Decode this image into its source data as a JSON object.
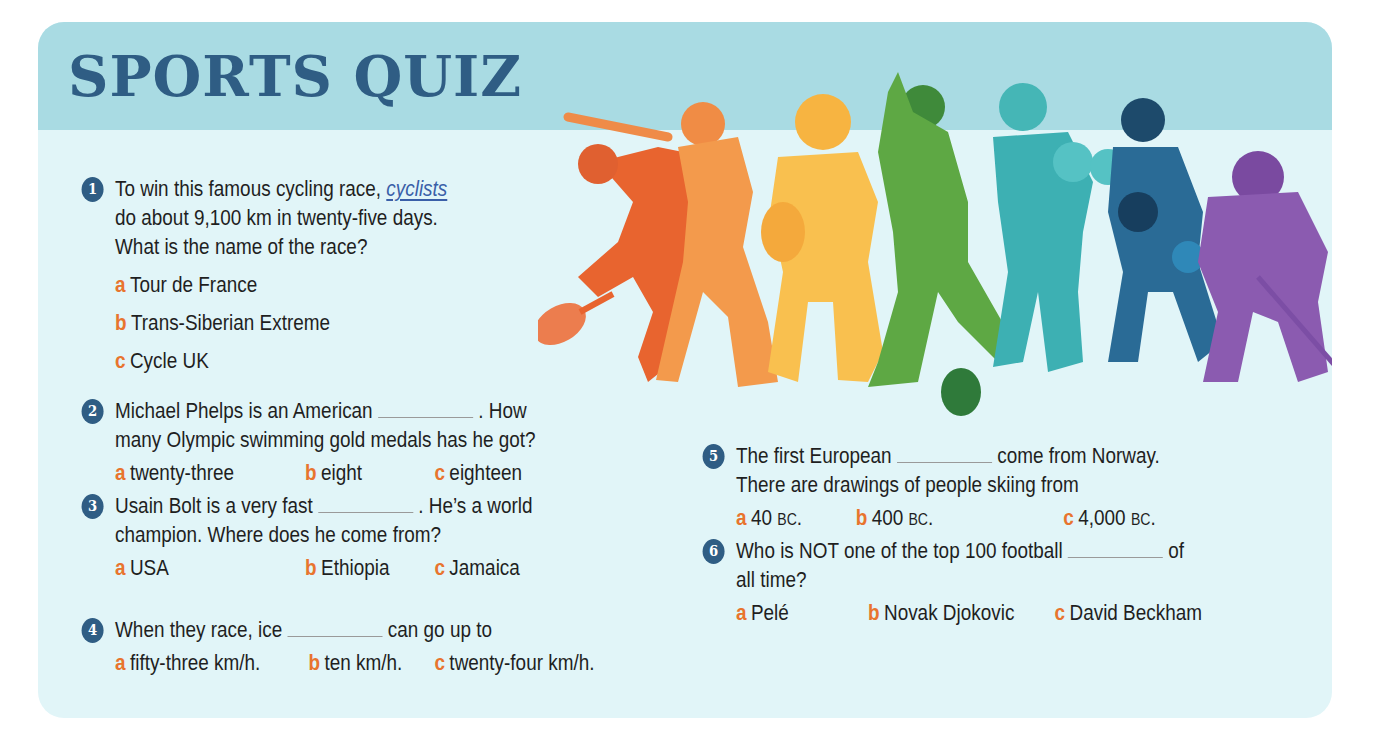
{
  "title": "SPORTS QUIZ",
  "colors": {
    "title": "#2f5d84",
    "header_band": "#a9dbe3",
    "card_bg": "#e1f5f8",
    "option_letter": "#e8742e",
    "badge": "#2f5d84",
    "link": "#3a5fa8"
  },
  "illustration": {
    "description": "sports-silhouettes",
    "figures": [
      "tennis-player",
      "baseball-batter",
      "american-football-player",
      "footballer",
      "boxer",
      "basketball-player",
      "ice-hockey-player"
    ]
  },
  "questions": [
    {
      "number": "1",
      "lines": [
        "To win this famous cycling race, ",
        "do about 9,100 km in twenty-five days.",
        "What is the name of the race?"
      ],
      "gap_word": "cyclists",
      "options": [
        {
          "letter": "a",
          "text": "Tour de France"
        },
        {
          "letter": "b",
          "text": "Trans-Siberian Extreme"
        },
        {
          "letter": "c",
          "text": "Cycle UK"
        }
      ]
    },
    {
      "number": "2",
      "line1_before": "Michael Phelps is an American",
      "line1_after": ". How",
      "line2": "many Olympic swimming gold medals has he got?",
      "options": [
        {
          "letter": "a",
          "text": "twenty-three"
        },
        {
          "letter": "b",
          "text": "eight"
        },
        {
          "letter": "c",
          "text": "eighteen"
        }
      ]
    },
    {
      "number": "3",
      "line1_before": "Usain Bolt is a very fast",
      "line1_after": ". He’s a world",
      "line2": "champion. Where does he come from?",
      "options": [
        {
          "letter": "a",
          "text": "USA"
        },
        {
          "letter": "b",
          "text": "Ethiopia"
        },
        {
          "letter": "c",
          "text": "Jamaica"
        }
      ]
    },
    {
      "number": "4",
      "line1_before": "When they race, ice",
      "line1_after": "can go up to",
      "options": [
        {
          "letter": "a",
          "text": "fifty-three km/h."
        },
        {
          "letter": "b",
          "text": "ten km/h."
        },
        {
          "letter": "c",
          "text": "twenty-four km/h."
        }
      ]
    },
    {
      "number": "5",
      "line1_before": "The first European",
      "line1_after": "come from Norway.",
      "line2": "There are drawings of people skiing from",
      "options": [
        {
          "letter": "a",
          "num": "40",
          "era": "BC",
          "end": "."
        },
        {
          "letter": "b",
          "num": "400",
          "era": "BC",
          "end": "."
        },
        {
          "letter": "c",
          "num": "4,000",
          "era": "BC",
          "end": "."
        }
      ]
    },
    {
      "number": "6",
      "line1_before": "Who is NOT one of the top 100 football",
      "line1_after": "of",
      "line2": "all time?",
      "options": [
        {
          "letter": "a",
          "text": "Pelé"
        },
        {
          "letter": "b",
          "text": "Novak Djokovic"
        },
        {
          "letter": "c",
          "text": "David Beckham"
        }
      ]
    }
  ]
}
